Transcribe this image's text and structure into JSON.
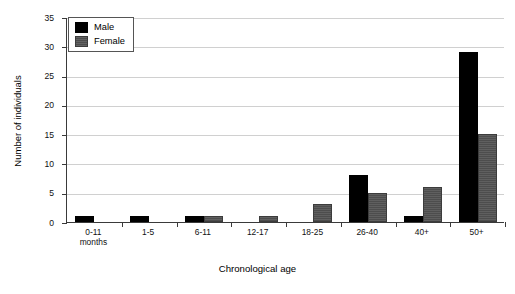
{
  "chart_data": {
    "type": "bar",
    "title": "",
    "xlabel": "Chronological age",
    "ylabel": "Number of individuals",
    "categories": [
      "0-11 months",
      "1-5",
      "6-11",
      "12-17",
      "18-25",
      "26-40",
      "40+",
      "50+"
    ],
    "category_lines": [
      [
        "0-11",
        "months"
      ],
      [
        "1-5"
      ],
      [
        "6-11"
      ],
      [
        "12-17"
      ],
      [
        "18-25"
      ],
      [
        "26-40"
      ],
      [
        "40+"
      ],
      [
        "50+"
      ]
    ],
    "series": [
      {
        "name": "Male",
        "color": "#000000",
        "values": [
          1,
          1,
          1,
          0,
          0,
          8,
          1,
          29
        ]
      },
      {
        "name": "Female",
        "color": "#4d4d4d",
        "values": [
          0,
          0,
          1,
          1,
          3,
          5,
          6,
          15
        ]
      }
    ],
    "ylim": [
      0,
      35
    ],
    "yticks": [
      0,
      5,
      10,
      15,
      20,
      25,
      30,
      35
    ],
    "ytick_labels": [
      "0",
      "5",
      "10",
      "15",
      "20",
      "25",
      "30",
      "35"
    ],
    "grid": true,
    "grid_axis": "y",
    "legend_position": "top-left",
    "legend_entries": [
      "Male",
      "Female"
    ]
  }
}
